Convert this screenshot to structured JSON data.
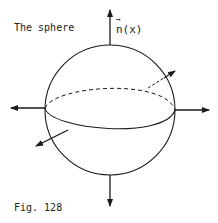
{
  "title": "The sphere",
  "normal_label": "n(x)",
  "normal_vector_mark": "→",
  "caption": "Fig. 128",
  "colors": {
    "ink": "#1a1a1a",
    "background": "#ffffff"
  }
}
